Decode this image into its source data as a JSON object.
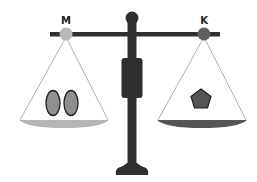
{
  "diagram": {
    "type": "balance-scale",
    "left_pan": {
      "label": "M",
      "pivot_color": "#b8b8b8",
      "rim_color": "#b5b5b5",
      "contents": [
        {
          "shape": "oval",
          "fill": "#8f8f8f"
        },
        {
          "shape": "oval",
          "fill": "#8f8f8f"
        }
      ]
    },
    "right_pan": {
      "label": "K",
      "pivot_color": "#5e5e5e",
      "rim_color": "#555555",
      "contents": [
        {
          "shape": "pentagon",
          "fill": "#555555"
        }
      ]
    },
    "colors": {
      "beam": "#2f2f2f",
      "post": "#2f2f2f",
      "string": "#9a9a9a",
      "outline": "#1f1f1f"
    }
  }
}
